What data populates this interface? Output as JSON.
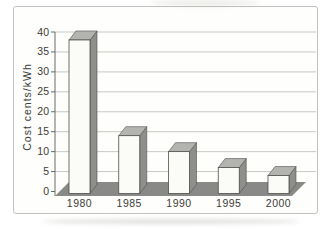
{
  "chart_data": {
    "type": "bar",
    "style": "3d-column-grayscale",
    "categories": [
      "1980",
      "1985",
      "1990",
      "1995",
      "2000"
    ],
    "values": [
      38,
      14,
      10,
      6,
      4
    ],
    "ylabel": "Cost cents/kWh",
    "ylim": [
      0,
      40
    ],
    "yticks": [
      0,
      5,
      10,
      15,
      20,
      25,
      30,
      35,
      40
    ],
    "grid": true,
    "legend": "none"
  },
  "colors": {
    "background": "#ffffff",
    "frame": "#c2c2be",
    "gridline": "#c8c8c4",
    "axis": "#6a6a64",
    "text": "#3c3c38",
    "bar_front": "#fbfbf8",
    "bar_top": "#b3b3b0",
    "bar_side": "#8e8e8b",
    "floor": "#898987",
    "outline": "#4f4f4a"
  }
}
